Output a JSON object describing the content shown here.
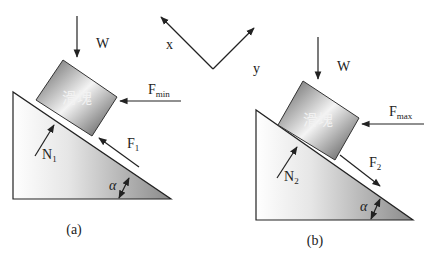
{
  "diagram": {
    "axes": {
      "x_label": "x",
      "y_label": "y"
    },
    "panel_a": {
      "caption": "(a)",
      "block_label": "滑塊",
      "weight_label": "W",
      "push_force": {
        "base": "F",
        "sub": "min"
      },
      "friction_force": {
        "base": "F",
        "sub": "1"
      },
      "normal_force": {
        "base": "N",
        "sub": "1"
      },
      "angle_label": "α"
    },
    "panel_b": {
      "caption": "(b)",
      "block_label": "滑塊",
      "weight_label": "W",
      "push_force": {
        "base": "F",
        "sub": "max"
      },
      "friction_force": {
        "base": "F",
        "sub": "2"
      },
      "normal_force": {
        "base": "N",
        "sub": "2"
      },
      "angle_label": "α"
    },
    "colors": {
      "stroke": "#222222",
      "incline_light": "#ffffff",
      "incline_dark": "#8a8a8a",
      "block_dark": "#5a5a5a",
      "block_light": "#f4f4f4"
    }
  }
}
